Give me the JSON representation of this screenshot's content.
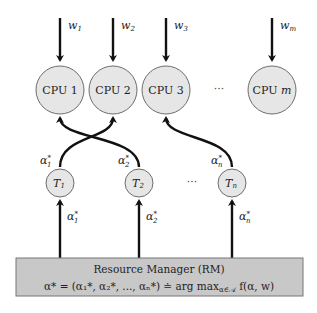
{
  "workloads": [
    {
      "base": "w",
      "sub": "1"
    },
    {
      "base": "w",
      "sub": "2"
    },
    {
      "base": "w",
      "sub": "3"
    },
    {
      "base": "w",
      "sub": "m"
    }
  ],
  "cpus": [
    {
      "label": "CPU 1"
    },
    {
      "label": "CPU 2"
    },
    {
      "label": "CPU 3"
    },
    {
      "label": "CPU m"
    }
  ],
  "cpu_ellipsis": "···",
  "tasks": [
    {
      "base": "T",
      "sub": "1",
      "alpha_sub": "1"
    },
    {
      "base": "T",
      "sub": "2",
      "alpha_sub": "2"
    },
    {
      "base": "T",
      "sub": "n",
      "alpha_sub": "n"
    }
  ],
  "task_ellipsis": "···",
  "assignments": [
    {
      "from_task": 0,
      "to_cpu": 1
    },
    {
      "from_task": 1,
      "to_cpu": 0
    },
    {
      "from_task": 2,
      "to_cpu": 2
    }
  ],
  "alpha_symbol": "α",
  "alpha_star": "*",
  "resource_manager": {
    "title": "Resource Manager (RM)",
    "formula": "α* = (α₁*, α₂*, ..., αₙ*) ≐ arg max",
    "formula_sub": "α∈𝒜",
    "formula_tail": " f(α, w)"
  }
}
